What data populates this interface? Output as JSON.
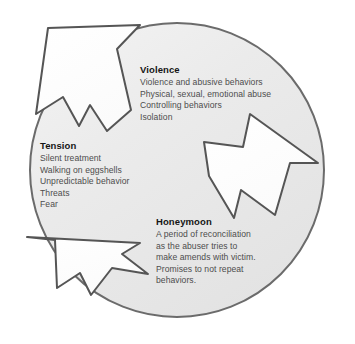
{
  "diagram": {
    "type": "cycle-diagram",
    "colors": {
      "circle_fill": "#e9e9e9",
      "circle_fill_highlight": "#f4f4f4",
      "circle_stroke": "#6b6b6b",
      "arrow_fill": "#ffffff",
      "arrow_stroke": "#555555",
      "heading_text": "#151515",
      "body_text": "#4d4d4d",
      "background": "#ffffff"
    },
    "stages": [
      {
        "id": "violence",
        "heading": "Violence",
        "lines": [
          "Violence and abusive behaviors",
          "Physical, sexual, emotional abuse",
          "Controlling behaviors",
          "Isolation"
        ]
      },
      {
        "id": "tension",
        "heading": "Tension",
        "lines": [
          "Silent treatment",
          "Walking on eggshells",
          "Unpredictable behavior",
          "Threats",
          "Fear"
        ]
      },
      {
        "id": "honeymoon",
        "heading": "Honeymoon",
        "lines": [
          "A period of reconciliation",
          "as the abuser tries to",
          "make amends with victim.",
          "Promises to not repeat",
          "behaviors."
        ]
      }
    ],
    "arrows": [
      {
        "id": "arrow-upper-left",
        "direction": "up-left",
        "from": "honeymoon",
        "to": "tension"
      },
      {
        "id": "arrow-right",
        "direction": "down-right",
        "from": "violence",
        "to": "honeymoon"
      },
      {
        "id": "arrow-lower-left",
        "direction": "down-left",
        "from": "tension",
        "to": "violence"
      }
    ]
  }
}
